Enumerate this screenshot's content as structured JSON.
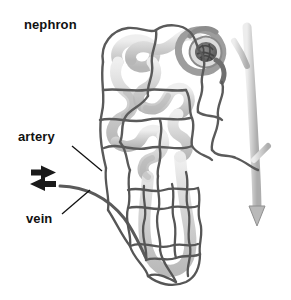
{
  "figure": {
    "title": "nephron",
    "background_color": "#ffffff",
    "width": 291,
    "height": 300
  },
  "labels": [
    {
      "id": "nephron",
      "text": "nephron",
      "x": 24,
      "y": 17,
      "has_leader_line": false
    },
    {
      "id": "artery",
      "text": "artery",
      "x": 18,
      "y": 129,
      "has_leader_line": true,
      "leader_from": [
        72,
        146
      ],
      "leader_to": [
        102,
        171
      ]
    },
    {
      "id": "vein",
      "text": "vein",
      "x": 26,
      "y": 211,
      "has_leader_line": true,
      "leader_from": [
        62,
        214
      ],
      "leader_to": [
        90,
        190
      ]
    }
  ],
  "flow_arrows": [
    {
      "id": "artery-inflow-arrow",
      "direction": "right",
      "y": 172,
      "x": 31,
      "color": "#1a1a1a",
      "meaning": "blood flowing in through artery"
    },
    {
      "id": "vein-outflow-arrow",
      "direction": "left",
      "y": 184,
      "x": 31,
      "color": "#1a1a1a",
      "meaning": "blood flowing out through vein"
    },
    {
      "id": "urine-outflow-arrow",
      "direction": "down",
      "x": 257,
      "y": 216,
      "color": "#b9b9b9",
      "meaning": "filtrate draining down the collecting duct"
    }
  ],
  "structures": [
    {
      "id": "glomerulus",
      "name": "glomerulus",
      "tone": "dark",
      "color": "#6e6e6e",
      "position": "upper-right"
    },
    {
      "id": "bowmans-capsule",
      "name": "Bowman's capsule",
      "tone": "mid",
      "color": "#9a9a9a",
      "position": "upper-right"
    },
    {
      "id": "convoluted-tubule",
      "name": "convoluted tubule",
      "tone": "light",
      "color": "#d4d4d4",
      "position": "upper-centre"
    },
    {
      "id": "loop-of-henle",
      "name": "loop of Henle",
      "tone": "light",
      "color": "#cccccc",
      "position": "lower-centre"
    },
    {
      "id": "peritubular-capillary-network",
      "name": "capillary network",
      "tone": "dark-outline",
      "color": "#595959",
      "position": "centre"
    },
    {
      "id": "vasa-recta-mesh",
      "name": "vasa recta mesh",
      "tone": "dark-outline",
      "color": "#555555",
      "position": "bottom-centre"
    },
    {
      "id": "collecting-duct",
      "name": "collecting duct",
      "tone": "light",
      "color": "#c6c6c6",
      "position": "right"
    },
    {
      "id": "renal-artery-vessel",
      "name": "artery vessel",
      "tone": "dark",
      "color": "#4d4d4d",
      "position": "horizontal-upper"
    },
    {
      "id": "renal-vein-vessel",
      "name": "vein vessel",
      "tone": "dark",
      "color": "#4d4d4d",
      "position": "horizontal-lower"
    }
  ],
  "palette": {
    "ink": "#111111",
    "vessel_dark": "#4d4d4d",
    "capillary": "#5d5d5d",
    "tubule_light": "#d2d2d2",
    "tubule_mid": "#a8a8a8",
    "glomerulus_dark": "#6b6b6b",
    "duct_light": "#c6c6c6",
    "background": "#ffffff"
  }
}
